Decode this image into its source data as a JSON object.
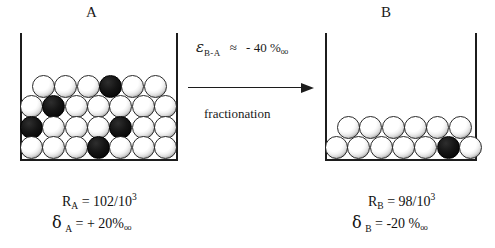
{
  "diagram": {
    "type": "isotope-fractionation-schematic",
    "vessels": [
      {
        "id": "a",
        "title": "A",
        "rows": [
          {
            "count": 6,
            "offset": 12,
            "black_positions": [
              4
            ]
          },
          {
            "count": 7,
            "offset": 0,
            "black_positions": [
              2
            ]
          },
          {
            "count": 7,
            "offset": 0,
            "black_positions": [
              1,
              5
            ]
          },
          {
            "count": 7,
            "offset": 0,
            "black_positions": [
              4
            ]
          }
        ],
        "ratio_label": "R",
        "ratio_sub": "A",
        "ratio_eq": " = 102/10",
        "ratio_exp": "3",
        "delta_sym": "δ",
        "delta_sub": "A",
        "delta_value": " = + 20",
        "delta_permil": "‰"
      },
      {
        "id": "b",
        "title": "B",
        "rows": [
          {
            "count": 6,
            "offset": 12,
            "black_positions": []
          },
          {
            "count": 7,
            "offset": 0,
            "black_positions": [
              6
            ]
          }
        ],
        "ratio_label": "R",
        "ratio_sub": "B",
        "ratio_eq": " = 98/10",
        "ratio_exp": "3",
        "delta_sym": "δ",
        "delta_sub": "B",
        "delta_value": " = -20 ",
        "delta_permil": "‰"
      }
    ],
    "annotation": {
      "epsilon_symbol": "ε",
      "epsilon_subscript": "B-A",
      "approx_sign": "≈",
      "epsilon_value": "- 40",
      "epsilon_permil": "‰",
      "process_label": "fractionation",
      "arrow_direction": "right"
    },
    "colors": {
      "ink": "#1c1c1c",
      "ball_light": "#ffffff",
      "ball_dark": "#000000",
      "background": "#ffffff"
    }
  }
}
